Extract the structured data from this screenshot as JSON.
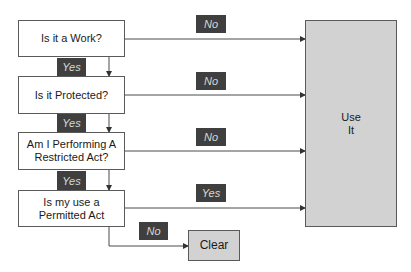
{
  "diagram": {
    "questions": [
      {
        "id": "q1",
        "text": "Is it a Work?"
      },
      {
        "id": "q2",
        "text": "Is it Protected?"
      },
      {
        "id": "q3",
        "text": "Am I Performing A\nRestricted Act?"
      },
      {
        "id": "q4",
        "text": "Is my use a\nPermitted Act"
      }
    ],
    "outcomes": {
      "use_it": "Use\nIt",
      "clear": "Clear"
    },
    "edge_labels": {
      "q1_down": "Yes",
      "q2_down": "Yes",
      "q3_down": "Yes",
      "q1_right": "No",
      "q2_right": "No",
      "q3_right": "No",
      "q4_right": "Yes",
      "q4_down": "No"
    },
    "edges": [
      {
        "from": "Is it a Work?",
        "to": "Is it Protected?",
        "label": "Yes"
      },
      {
        "from": "Is it Protected?",
        "to": "Am I Performing A Restricted Act?",
        "label": "Yes"
      },
      {
        "from": "Am I Performing A Restricted Act?",
        "to": "Is my use a Permitted Act",
        "label": "Yes"
      },
      {
        "from": "Is it a Work?",
        "to": "Use It",
        "label": "No"
      },
      {
        "from": "Is it Protected?",
        "to": "Use It",
        "label": "No"
      },
      {
        "from": "Am I Performing A Restricted Act?",
        "to": "Use It",
        "label": "No"
      },
      {
        "from": "Is my use a Permitted Act",
        "to": "Use It",
        "label": "Yes"
      },
      {
        "from": "Is my use a Permitted Act",
        "to": "Clear",
        "label": "No"
      }
    ],
    "colors": {
      "line": "#4a4a4a",
      "outcome_fill": "#d2d2d2",
      "tag_fill": "#3f3f3f",
      "tag_text": "#d8d8d8"
    }
  }
}
